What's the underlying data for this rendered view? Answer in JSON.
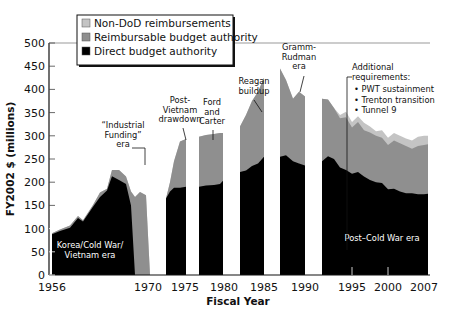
{
  "chart_data": {
    "type": "area",
    "title": "",
    "xlabel": "Fiscal Year",
    "ylabel": "FY2002 $ (millions)",
    "ylim": [
      0,
      500
    ],
    "yticks": [
      0,
      50,
      100,
      150,
      200,
      250,
      300,
      350,
      400,
      450,
      500
    ],
    "xtick_labels": [
      {
        "label": "1956",
        "x": 52
      },
      {
        "label": "1970",
        "x": 148
      },
      {
        "label": "1975",
        "x": 185
      },
      {
        "label": "1980",
        "x": 224
      },
      {
        "label": "1985",
        "x": 264
      },
      {
        "label": "1990",
        "x": 305
      },
      {
        "label": "1995",
        "x": 352
      },
      {
        "label": "2000",
        "x": 388
      },
      {
        "label": "2007",
        "x": 424
      }
    ],
    "grid": false,
    "legend_position": "top-left",
    "legend": [
      {
        "name": "Non-DoD reimbursements",
        "color": "#c4c4c4"
      },
      {
        "name": "Reimbursable budget authority",
        "color": "#8f8f8f"
      },
      {
        "name": "Direct budget authority",
        "color": "#000000"
      }
    ],
    "series_note": "Stacked areas; each point = [x_pixel, direct, direct+reimbursable, total incl. non-DoD] in $M",
    "segments": [
      {
        "points": [
          [
            52,
            88,
            90,
            90
          ],
          [
            60,
            95,
            98,
            98
          ],
          [
            70,
            102,
            107,
            107
          ],
          [
            78,
            123,
            127,
            127
          ],
          [
            83,
            115,
            118,
            118
          ],
          [
            93,
            147,
            151,
            151
          ],
          [
            100,
            168,
            178,
            178
          ],
          [
            107,
            182,
            186,
            186
          ],
          [
            112,
            213,
            226,
            226
          ],
          [
            119,
            205,
            226,
            226
          ],
          [
            126,
            196,
            212,
            212
          ],
          [
            131,
            150,
            180,
            180
          ],
          [
            135,
            0,
            168,
            168
          ],
          [
            140,
            0,
            179,
            179
          ],
          [
            146,
            0,
            172,
            172
          ],
          [
            150,
            0,
            0,
            0
          ]
        ]
      },
      {
        "points": [
          [
            166,
            165,
            165,
            165
          ],
          [
            170,
            180,
            200,
            200
          ],
          [
            174,
            188,
            245,
            245
          ],
          [
            180,
            188,
            288,
            288
          ],
          [
            186,
            190,
            293,
            293
          ]
        ]
      },
      {
        "points": [
          [
            199,
            190,
            298,
            298
          ],
          [
            206,
            193,
            302,
            302
          ],
          [
            214,
            194,
            304,
            304
          ],
          [
            220,
            196,
            306,
            306
          ],
          [
            223,
            203,
            306,
            306
          ]
        ]
      },
      {
        "points": [
          [
            240,
            222,
            320,
            320
          ],
          [
            246,
            225,
            345,
            345
          ],
          [
            252,
            235,
            375,
            375
          ],
          [
            258,
            240,
            395,
            395
          ],
          [
            264,
            255,
            425,
            425
          ]
        ]
      },
      {
        "points": [
          [
            280,
            255,
            445,
            445
          ],
          [
            286,
            258,
            420,
            420
          ],
          [
            293,
            245,
            380,
            380
          ],
          [
            299,
            240,
            395,
            395
          ],
          [
            305,
            236,
            385,
            385
          ]
        ]
      },
      {
        "points": [
          [
            322,
            245,
            380,
            380
          ],
          [
            328,
            256,
            378,
            378
          ],
          [
            334,
            250,
            360,
            360
          ],
          [
            340,
            232,
            338,
            345
          ],
          [
            346,
            226,
            340,
            352
          ],
          [
            352,
            218,
            318,
            330
          ],
          [
            358,
            222,
            330,
            342
          ],
          [
            364,
            212,
            312,
            328
          ],
          [
            370,
            205,
            307,
            320
          ],
          [
            376,
            200,
            300,
            310
          ],
          [
            382,
            198,
            296,
            312
          ],
          [
            388,
            185,
            280,
            296
          ],
          [
            394,
            186,
            290,
            306
          ],
          [
            400,
            180,
            284,
            300
          ],
          [
            406,
            176,
            278,
            294
          ],
          [
            412,
            176,
            272,
            290
          ],
          [
            418,
            174,
            278,
            298
          ],
          [
            424,
            174,
            280,
            300
          ],
          [
            428,
            175,
            282,
            300
          ]
        ]
      }
    ],
    "annotations": [
      {
        "text": [
          "Korea/Cold War/",
          "Vietnam era"
        ],
        "x": 90,
        "y": 248,
        "color": "white"
      },
      {
        "text": [
          "“Industrial",
          "Funding”",
          "era"
        ],
        "x": 123,
        "y": 128,
        "color": "black"
      },
      {
        "text": [
          "Post-",
          "Vietnam",
          "drawdown"
        ],
        "x": 180,
        "y": 103,
        "color": "black"
      },
      {
        "text": [
          "Ford",
          "and",
          "Carter"
        ],
        "x": 212,
        "y": 105,
        "color": "black"
      },
      {
        "text": [
          "Reagan",
          "buildup"
        ],
        "x": 254,
        "y": 84,
        "color": "black"
      },
      {
        "text": [
          "Gramm-",
          "Rudman",
          "era"
        ],
        "x": 299,
        "y": 50,
        "color": "black"
      },
      {
        "text": [
          "Post–Cold War era"
        ],
        "x": 382,
        "y": 241,
        "color": "white"
      }
    ],
    "requirements_box": {
      "title": [
        "Additional",
        "requirements:"
      ],
      "items": [
        "PWT sustainment",
        "Trenton transition",
        "Tunnel 9"
      ]
    }
  }
}
